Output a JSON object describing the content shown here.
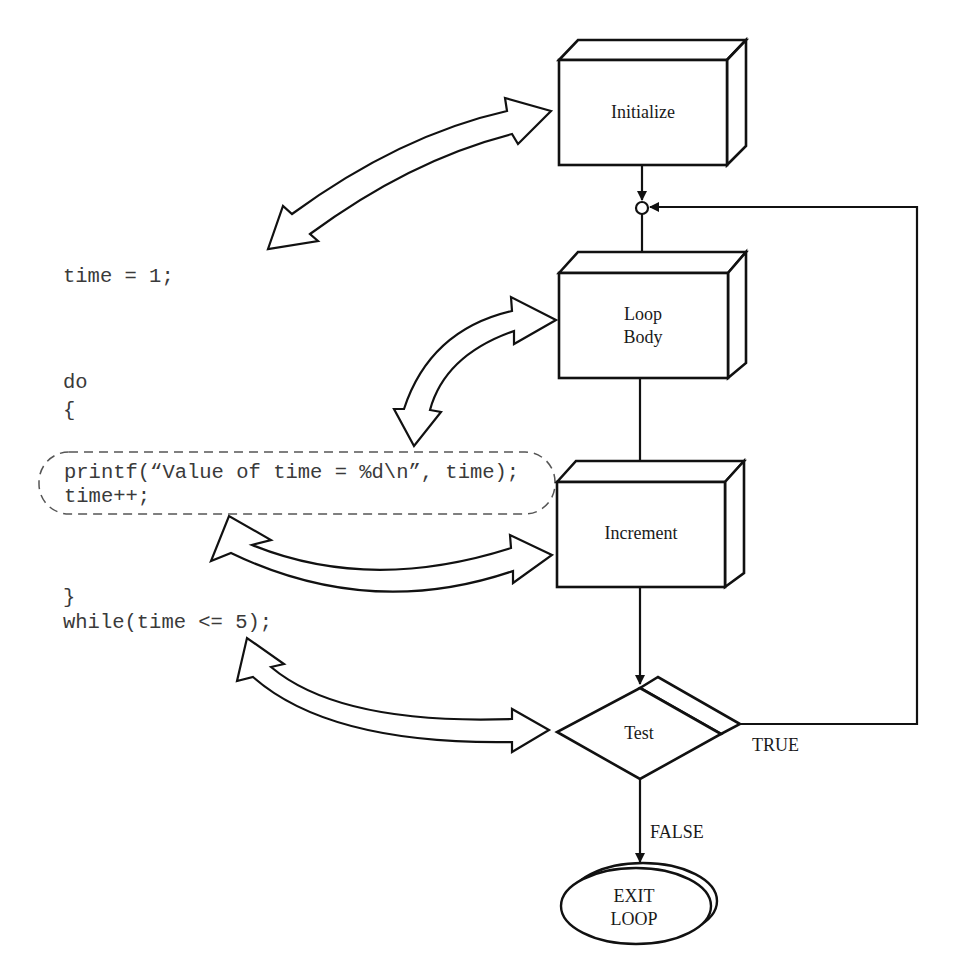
{
  "code": {
    "lines": {
      "init": "time = 1;",
      "do": "do",
      "open_brace": "{",
      "printf": "printf(“Value of time = %d\\n”, time);",
      "increment": "time++;",
      "close_brace": "}",
      "while": "while(time <= 5);"
    }
  },
  "flowchart": {
    "initialize": "Initialize",
    "loop_body": {
      "line1": "Loop",
      "line2": "Body"
    },
    "increment": "Increment",
    "test": "Test",
    "exit": {
      "line1": "EXIT",
      "line2": "LOOP"
    },
    "true_label": "TRUE",
    "false_label": "FALSE"
  },
  "colors": {
    "stroke": "#111111",
    "code_text": "#3a3a3a",
    "dashed_outline": "#555555",
    "background": "#ffffff"
  }
}
